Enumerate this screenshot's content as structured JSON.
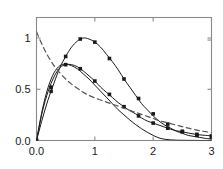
{
  "chart_data": {
    "type": "line",
    "title": "",
    "subtitle": "",
    "xlabel": "",
    "ylabel": "",
    "xlim": [
      0.0,
      3.0
    ],
    "ylim": [
      0.0,
      1.2
    ],
    "grid": false,
    "legend": "none",
    "frame": "box",
    "xticks": [
      0.0,
      1.0,
      2.0,
      3.0
    ],
    "xtick_labels": [
      "0.0",
      "1",
      "2",
      "3"
    ],
    "yticks": [
      0.0,
      0.5,
      1.0
    ],
    "ytick_labels": [
      "0.0",
      "0.5",
      "1"
    ],
    "x": [
      0.0,
      0.1,
      0.2,
      0.3,
      0.4,
      0.5,
      0.6,
      0.7,
      0.8,
      0.9,
      1.0,
      1.1,
      1.2,
      1.3,
      1.4,
      1.5,
      1.6,
      1.7,
      1.8,
      1.9,
      2.0,
      2.1,
      2.2,
      2.3,
      2.4,
      2.5,
      2.6,
      2.7,
      2.8,
      2.9,
      3.0
    ],
    "series": [
      {
        "name": "peaked-solid-marked",
        "style": "solid",
        "marker": "square",
        "color": "#1a1a1a",
        "marker_x": [
          0.0,
          0.25,
          0.5,
          0.75,
          1.0,
          1.25,
          1.5,
          1.75,
          2.0,
          2.25,
          2.5,
          2.75,
          3.0
        ],
        "marker_y": [
          0.0,
          0.48,
          0.82,
          0.99,
          0.96,
          0.8,
          0.6,
          0.41,
          0.26,
          0.16,
          0.09,
          0.05,
          0.03
        ],
        "values": [
          0.0,
          0.21,
          0.4,
          0.56,
          0.71,
          0.82,
          0.91,
          0.97,
          1.0,
          0.99,
          0.96,
          0.91,
          0.84,
          0.77,
          0.69,
          0.6,
          0.52,
          0.44,
          0.36,
          0.3,
          0.24,
          0.19,
          0.15,
          0.12,
          0.09,
          0.07,
          0.05,
          0.04,
          0.03,
          0.02,
          0.015
        ]
      },
      {
        "name": "broad-solid-marked",
        "style": "solid",
        "marker": "square",
        "color": "#1a1a1a",
        "marker_x": [
          0.0,
          0.25,
          0.5,
          0.75,
          1.0,
          1.25,
          1.5,
          1.75,
          2.0,
          2.25,
          2.5,
          2.75,
          3.0
        ],
        "marker_y": [
          0.0,
          0.52,
          0.74,
          0.7,
          0.58,
          0.45,
          0.33,
          0.24,
          0.17,
          0.12,
          0.085,
          0.06,
          0.045
        ],
        "values": [
          0.0,
          0.28,
          0.48,
          0.62,
          0.71,
          0.74,
          0.74,
          0.72,
          0.68,
          0.63,
          0.58,
          0.52,
          0.47,
          0.42,
          0.37,
          0.33,
          0.29,
          0.26,
          0.22,
          0.19,
          0.17,
          0.15,
          0.13,
          0.11,
          0.095,
          0.085,
          0.073,
          0.063,
          0.055,
          0.05,
          0.045
        ]
      },
      {
        "name": "fast-decay-solid",
        "style": "solid",
        "marker": "none",
        "color": "#1a1a1a",
        "values": [
          0.0,
          0.3,
          0.52,
          0.66,
          0.73,
          0.745,
          0.73,
          0.7,
          0.65,
          0.6,
          0.54,
          0.48,
          0.42,
          0.36,
          0.3,
          0.25,
          0.2,
          0.155,
          0.115,
          0.08,
          0.05,
          0.025,
          0.012,
          0.006,
          0.003,
          0.002,
          0.001,
          0.001,
          0.0,
          0.0,
          0.0
        ]
      },
      {
        "name": "monotone-dashed",
        "style": "dashed",
        "marker": "none",
        "color": "#555555",
        "values": [
          1.06,
          0.93,
          0.82,
          0.73,
          0.66,
          0.6,
          0.55,
          0.51,
          0.47,
          0.44,
          0.415,
          0.395,
          0.375,
          0.355,
          0.335,
          0.315,
          0.295,
          0.275,
          0.255,
          0.235,
          0.215,
          0.195,
          0.18,
          0.165,
          0.15,
          0.135,
          0.12,
          0.108,
          0.096,
          0.086,
          0.078
        ]
      }
    ]
  }
}
